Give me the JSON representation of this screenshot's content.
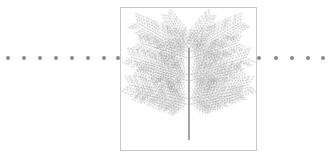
{
  "scene": {
    "description": "Fractal fern-like tree drawn in grey stippling inside a light-bordered square frame, with a horizontal dotted line passing behind it",
    "colors": {
      "background": "#ffffff",
      "dots": "#8a8a8a",
      "frame_border": "#c8c8c8",
      "tree": "#8c8c8c",
      "trunk": "#9a9a9a"
    },
    "dotted_line": {
      "y": 58,
      "left_dots_x": [
        8,
        24,
        40,
        56,
        72,
        88,
        104,
        118
      ],
      "right_dots_x": [
        259,
        276,
        292,
        308,
        323
      ]
    },
    "frame": {
      "x": 120,
      "y": 7,
      "width": 137,
      "height": 144
    },
    "tree": {
      "trunk_x": 69,
      "trunk_top": 40,
      "trunk_bottom": 134,
      "tiers": [
        {
          "y": 45,
          "spread": 52,
          "rise": 30
        },
        {
          "y": 68,
          "spread": 58,
          "rise": 18
        },
        {
          "y": 92,
          "spread": 60,
          "rise": 14
        }
      ]
    }
  }
}
